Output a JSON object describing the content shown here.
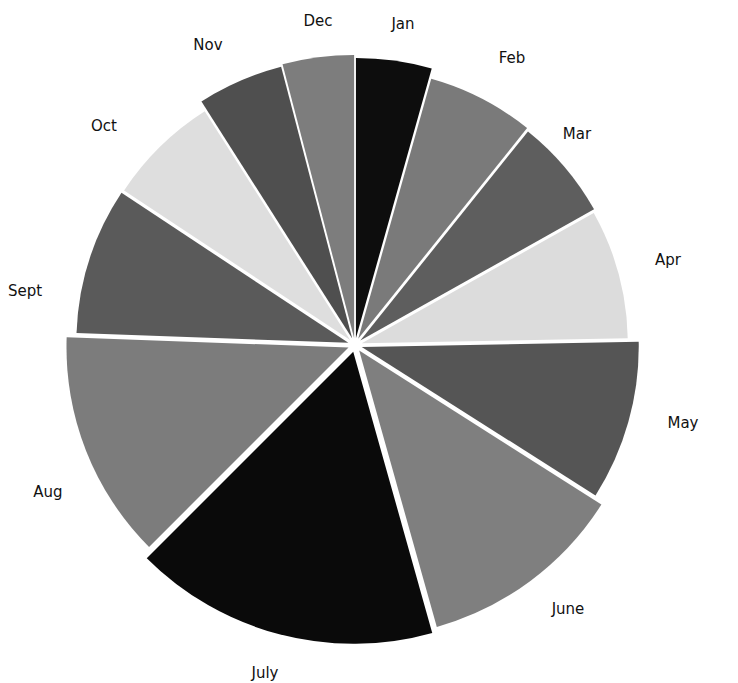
{
  "chart_data": {
    "type": "pie",
    "title": "",
    "exploded": true,
    "start_angle_deg": 0,
    "direction": "clockwise",
    "categories": [
      "Jan",
      "Feb",
      "Mar",
      "Apr",
      "May",
      "June",
      "July",
      "Aug",
      "Sept",
      "Oct",
      "Nov",
      "Dec"
    ],
    "values": [
      15,
      22,
      21,
      27,
      32,
      40,
      58,
      45,
      30,
      23,
      17,
      14
    ],
    "value_unit": "approx. share of 360° (estimated from slice angles)",
    "colors": [
      "#0d0d0d",
      "#7a7a7a",
      "#5e5e5e",
      "#dcdcdc",
      "#555555",
      "#7f7f7f",
      "#0a0a0a",
      "#7c7c7c",
      "#5a5a5a",
      "#dedede",
      "#4f4f4f",
      "#7d7d7d"
    ],
    "radii": [
      280,
      270,
      268,
      266,
      277,
      287,
      292,
      282,
      272,
      271,
      281,
      283
    ],
    "legend": "none (labels placed outside slices)"
  },
  "labels": {
    "jan": "Jan",
    "feb": "Feb",
    "mar": "Mar",
    "apr": "Apr",
    "may": "May",
    "june": "June",
    "july": "July",
    "aug": "Aug",
    "sept": "Sept",
    "oct": "Oct",
    "nov": "Nov",
    "dec": "Dec"
  },
  "label_positions": [
    [
      403,
      29
    ],
    [
      512,
      63
    ],
    [
      577,
      139
    ],
    [
      668,
      265
    ],
    [
      683,
      428
    ],
    [
      568,
      614
    ],
    [
      265,
      678
    ],
    [
      48,
      497
    ],
    [
      25,
      296
    ],
    [
      104,
      131
    ],
    [
      208,
      50
    ],
    [
      318,
      26
    ]
  ]
}
